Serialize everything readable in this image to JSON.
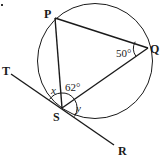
{
  "diagram": {
    "points": {
      "P": {
        "label": "P"
      },
      "Q": {
        "label": "Q"
      },
      "S": {
        "label": "S"
      },
      "T": {
        "label": "T"
      },
      "R": {
        "label": "R"
      }
    },
    "angles": {
      "Q": {
        "label": "50°"
      },
      "PSQ": {
        "label": "62°"
      },
      "x": {
        "label": "x"
      },
      "y": {
        "label": "y"
      }
    },
    "colors": {
      "stroke": "#1a1a1a",
      "background": "#ffffff"
    }
  }
}
